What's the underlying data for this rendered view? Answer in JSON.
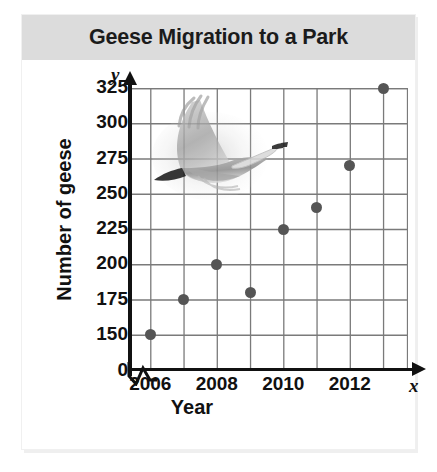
{
  "card": {
    "title": "Geese Migration to a Park",
    "background": "#fdfdfd",
    "title_band_color": "#dcdcdc"
  },
  "axes": {
    "y_variable_glyph": "y",
    "x_variable_glyph": "x",
    "y_axis_title": "Number of geese",
    "x_axis_title": "Year",
    "y_tick_labels": [
      "325",
      "300",
      "275",
      "250",
      "225",
      "200",
      "175",
      "150",
      "0"
    ],
    "x_tick_labels": [
      "2006",
      "2008",
      "2010",
      "2012"
    ],
    "break_symbol": "zig-zag",
    "grid_color": "#7a7a7a",
    "axis_color": "#111111"
  },
  "watermark": {
    "name": "flying-goose-illustration",
    "description": "grayscale goose in flight"
  },
  "chart_data": {
    "type": "scatter",
    "title": "Geese Migration to a Park",
    "xlabel": "Year",
    "ylabel": "Number of geese",
    "x": [
      2006,
      2007,
      2008,
      2009,
      2010,
      2011,
      2012,
      2013
    ],
    "values": [
      150,
      175,
      200,
      180,
      225,
      240,
      270,
      325
    ],
    "points": [
      {
        "x": 2006,
        "y": 150
      },
      {
        "x": 2007,
        "y": 175
      },
      {
        "x": 2008,
        "y": 200
      },
      {
        "x": 2009,
        "y": 180
      },
      {
        "x": 2010,
        "y": 225
      },
      {
        "x": 2011,
        "y": 240
      },
      {
        "x": 2012,
        "y": 270
      },
      {
        "x": 2013,
        "y": 325
      }
    ],
    "xlim": [
      2005.5,
      2013.5
    ],
    "ylim": [
      137.5,
      337.5
    ],
    "y_ticks": [
      150,
      175,
      200,
      225,
      250,
      275,
      300,
      325
    ],
    "x_ticks": [
      2006,
      2007,
      2008,
      2009,
      2010,
      2011,
      2012,
      2013
    ],
    "y_axis_broken": true,
    "x_axis_broken": true,
    "grid": true,
    "legend": "none",
    "marker_color": "#555555"
  }
}
